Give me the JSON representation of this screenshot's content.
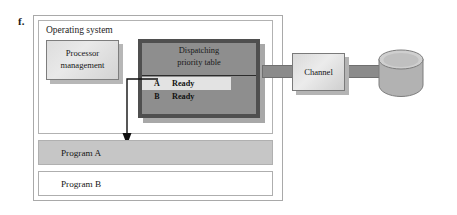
{
  "figure": {
    "letter": "f.",
    "caption": ""
  },
  "outer_frame": {
    "name": "figure-border"
  },
  "os": {
    "label": "Operating system"
  },
  "processor_management": {
    "line1": "Processor",
    "line2": "management"
  },
  "dispatching_table": {
    "title_line1": "Dispatching",
    "title_line2": "priority table",
    "columns": [
      "Program",
      "State"
    ],
    "rows": [
      {
        "name": "A",
        "state": "Ready",
        "highlighted": true
      },
      {
        "name": "B",
        "state": "Ready",
        "highlighted": false
      }
    ]
  },
  "channel": {
    "label": "Channel"
  },
  "disk": {
    "label": "disk-drive"
  },
  "programs": [
    {
      "label": "Program A",
      "active": true
    },
    {
      "label": "Program B",
      "active": false
    }
  ],
  "colors": {
    "page_background": "#ffffff",
    "frame_border": "#a9a9a9",
    "os_border": "#b2b2b2",
    "processor_box_fill": "#e2e2e2",
    "dispatch_table_fill": "#8e8e8e",
    "dispatch_table_border": "#4f4f4f",
    "highlight_row_fill": "#e3e3e3",
    "connector_fill": "#8b8b8b",
    "channel_fill": "#e0e0e0",
    "disk_fill": "#b9b9b9",
    "program_a_fill": "#c6c6c6",
    "program_b_fill": "#ffffff",
    "arrow_stroke": "#101010",
    "text": "#161616"
  }
}
